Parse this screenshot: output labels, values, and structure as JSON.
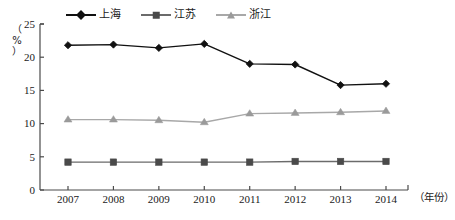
{
  "chart_data": {
    "type": "line",
    "title": "",
    "subtitle": "",
    "xlabel": "（年份）",
    "ylabel": "（%）",
    "categories": [
      "2007",
      "2008",
      "2009",
      "2010",
      "2011",
      "2012",
      "2013",
      "2014"
    ],
    "x": [
      2007,
      2008,
      2009,
      2010,
      2011,
      2012,
      2013,
      2014
    ],
    "ylim": [
      0,
      25
    ],
    "xlim": [
      2006.5,
      2014.5
    ],
    "yticks": [
      "0",
      "5",
      "10",
      "15",
      "20",
      "25"
    ],
    "ytick_values": [
      0,
      5,
      10,
      15,
      20,
      25
    ],
    "grid": false,
    "legend_position": "top-center",
    "series": [
      {
        "name": "上海",
        "marker": "diamond",
        "color": "#111111",
        "values": [
          21.8,
          21.9,
          21.4,
          22.0,
          19.0,
          18.9,
          15.8,
          16.0
        ]
      },
      {
        "name": "江苏",
        "marker": "square",
        "color": "#4a4a4a",
        "values": [
          4.2,
          4.2,
          4.2,
          4.2,
          4.2,
          4.3,
          4.3,
          4.3
        ]
      },
      {
        "name": "浙江",
        "marker": "triangle",
        "color": "#9a9a9a",
        "values": [
          10.6,
          10.6,
          10.5,
          10.2,
          11.5,
          11.6,
          11.7,
          11.9
        ]
      }
    ]
  },
  "axes": {
    "y_unit_top": "（",
    "y_unit_mid": "%",
    "y_unit_bottom": "）",
    "x_title": "（年份）"
  },
  "colors": {
    "shanghai": "#111111",
    "jiangsu": "#4a4a4a",
    "zhejiang": "#9a9a9a",
    "axis": "#4a4a4a",
    "background": "#ffffff"
  }
}
